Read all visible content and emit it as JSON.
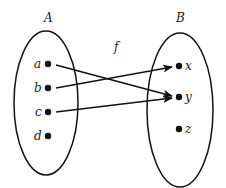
{
  "diagram": {
    "type": "function-mapping",
    "title_label": "f",
    "colors": {
      "stroke": "#111111",
      "text": "#222222",
      "background": "#ffffff"
    },
    "domain": {
      "label": "A",
      "elements": [
        {
          "id": "a",
          "label": "a"
        },
        {
          "id": "b",
          "label": "b"
        },
        {
          "id": "c",
          "label": "c"
        },
        {
          "id": "d",
          "label": "d"
        }
      ]
    },
    "codomain": {
      "label": "B",
      "elements": [
        {
          "id": "x",
          "label": "x"
        },
        {
          "id": "y",
          "label": "y"
        },
        {
          "id": "z",
          "label": "z"
        }
      ]
    },
    "mappings": [
      {
        "from": "a",
        "to": "y"
      },
      {
        "from": "b",
        "to": "x"
      },
      {
        "from": "c",
        "to": "y"
      }
    ]
  }
}
